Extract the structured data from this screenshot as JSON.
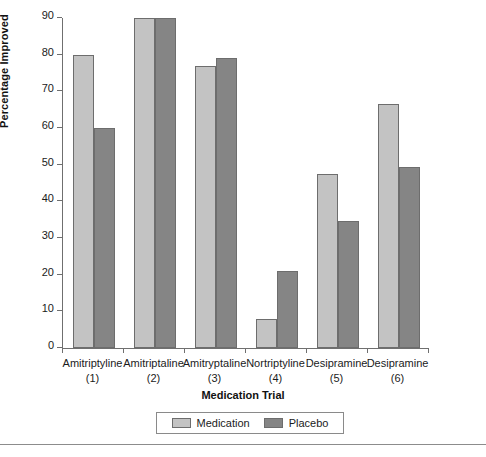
{
  "chart_data": {
    "type": "bar",
    "title": "",
    "xlabel": "Medication Trial",
    "ylabel": "Percentage Improved",
    "ylim": [
      0,
      90
    ],
    "yticks": [
      0,
      10,
      20,
      30,
      40,
      50,
      60,
      70,
      80,
      90
    ],
    "grid": false,
    "legend_position": "bottom-center",
    "categories": [
      "Amitriptyline",
      "Amitriptaline",
      "Amitryptaline",
      "Nortriptyline",
      "Desipramine",
      "Desipramine"
    ],
    "category_indices": [
      "(1)",
      "(2)",
      "(3)",
      "(4)",
      "(5)",
      "(6)"
    ],
    "series": [
      {
        "name": "Medication",
        "color": "#c3c3c3",
        "values": [
          80,
          90,
          77,
          8,
          47.5,
          66.5
        ]
      },
      {
        "name": "Placebo",
        "color": "#858585",
        "values": [
          60,
          90,
          79,
          21,
          34.7,
          49.5
        ]
      }
    ]
  },
  "colors": {
    "medication": "#c3c3c3",
    "placebo": "#858585",
    "bar_border": "#6d6d6d",
    "axis": "#6f6f6f",
    "text": "#1b1b1b",
    "background": "#ffffff"
  }
}
